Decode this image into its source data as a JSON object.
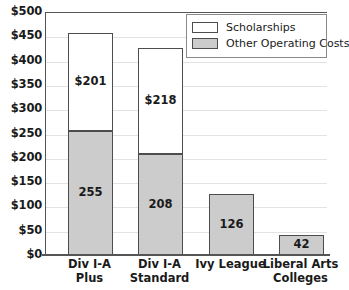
{
  "chart_data": {
    "type": "bar",
    "subtype": "stacked",
    "title": "",
    "xlabel": "",
    "ylabel": "",
    "ylim": [
      0,
      500
    ],
    "ytick_step": 50,
    "ytick_labels": [
      "$500",
      "$450",
      "$400",
      "$350",
      "$300",
      "$250",
      "$200",
      "$150",
      "$100",
      "$50",
      "$0"
    ],
    "ytick_values": [
      500,
      450,
      400,
      350,
      300,
      250,
      200,
      150,
      100,
      50,
      0
    ],
    "grid": true,
    "legend_position": "top-right",
    "categories": [
      "Div I-A Plus",
      "Div I-A Standard",
      "Ivy League",
      "Liberal Arts Colleges"
    ],
    "category_lines": [
      [
        "Div I-A",
        "Plus"
      ],
      [
        "Div I-A",
        "Standard"
      ],
      [
        "Ivy League",
        ""
      ],
      [
        "Liberal Arts",
        "Colleges"
      ]
    ],
    "series": [
      {
        "name": "Other Operating Costs",
        "color": "#cccccc",
        "values": [
          255,
          208,
          126,
          42
        ],
        "labels": [
          "255",
          "208",
          "126",
          "42"
        ]
      },
      {
        "name": "Scholarships",
        "color": "#ffffff",
        "values": [
          201,
          218,
          0,
          0
        ],
        "labels": [
          "$201",
          "$218",
          "",
          ""
        ]
      }
    ],
    "totals": [
      456,
      426,
      126,
      42
    ]
  },
  "legend": {
    "items": [
      {
        "label": "Scholarships",
        "swatch": "white"
      },
      {
        "label": "Other Operating Costs",
        "swatch": "gray"
      }
    ]
  },
  "colors": {
    "gray_fill": "#cccccc",
    "white_fill": "#ffffff",
    "bar_border": "#4d4d4d",
    "axis": "#555555",
    "gridline": "#e3e3e3",
    "text": "#1a1a1a"
  }
}
